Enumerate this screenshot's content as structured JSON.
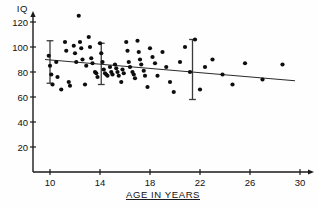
{
  "chart_data": {
    "type": "scatter",
    "title": "",
    "xlabel": "AGE IN YEARS",
    "ylabel": "IQ",
    "xlim": [
      8,
      30.6
    ],
    "ylim": [
      0,
      128
    ],
    "xticks": [
      10,
      14,
      18,
      22,
      26,
      30
    ],
    "xtick_labels": [
      "10",
      "14",
      "18",
      "22",
      "26",
      "30"
    ],
    "yticks": [
      20,
      40,
      60,
      80,
      100,
      120
    ],
    "ytick_labels": [
      "20",
      "40",
      "60",
      "80",
      "100",
      "120"
    ],
    "grid": false,
    "legend": null,
    "points": [
      [
        9.9,
        93
      ],
      [
        10.0,
        85
      ],
      [
        10.1,
        78
      ],
      [
        10.2,
        70
      ],
      [
        10.5,
        88
      ],
      [
        10.6,
        76
      ],
      [
        10.9,
        66
      ],
      [
        11.2,
        104
      ],
      [
        11.3,
        97
      ],
      [
        11.5,
        72
      ],
      [
        11.6,
        69
      ],
      [
        11.9,
        101
      ],
      [
        12.0,
        95
      ],
      [
        12.1,
        88
      ],
      [
        12.3,
        125
      ],
      [
        12.4,
        104
      ],
      [
        12.5,
        99
      ],
      [
        12.6,
        90
      ],
      [
        12.8,
        70
      ],
      [
        12.9,
        85
      ],
      [
        13.1,
        108
      ],
      [
        13.2,
        100
      ],
      [
        13.3,
        91
      ],
      [
        13.4,
        87
      ],
      [
        13.6,
        80
      ],
      [
        13.7,
        79
      ],
      [
        13.8,
        76
      ],
      [
        14.0,
        103
      ],
      [
        14.1,
        95
      ],
      [
        14.2,
        88
      ],
      [
        14.3,
        82
      ],
      [
        14.4,
        79
      ],
      [
        14.5,
        78
      ],
      [
        14.6,
        77
      ],
      [
        14.8,
        84
      ],
      [
        14.9,
        80
      ],
      [
        15.0,
        78
      ],
      [
        15.2,
        86
      ],
      [
        15.3,
        83
      ],
      [
        15.4,
        80
      ],
      [
        15.5,
        77
      ],
      [
        15.7,
        72
      ],
      [
        15.8,
        82
      ],
      [
        15.9,
        79
      ],
      [
        16.1,
        104
      ],
      [
        16.2,
        97
      ],
      [
        16.3,
        88
      ],
      [
        16.4,
        84
      ],
      [
        16.6,
        80
      ],
      [
        16.7,
        78
      ],
      [
        16.8,
        75
      ],
      [
        17.0,
        105
      ],
      [
        17.1,
        96
      ],
      [
        17.2,
        90
      ],
      [
        17.3,
        86
      ],
      [
        17.5,
        81
      ],
      [
        17.6,
        77
      ],
      [
        17.8,
        68
      ],
      [
        18.0,
        99
      ],
      [
        18.2,
        92
      ],
      [
        18.4,
        87
      ],
      [
        18.6,
        77
      ],
      [
        19.0,
        96
      ],
      [
        19.3,
        84
      ],
      [
        19.6,
        72
      ],
      [
        19.9,
        64
      ],
      [
        20.4,
        88
      ],
      [
        20.8,
        100
      ],
      [
        21.2,
        80
      ],
      [
        21.6,
        106
      ],
      [
        22.0,
        66
      ],
      [
        22.4,
        84
      ],
      [
        23.0,
        90
      ],
      [
        23.8,
        78
      ],
      [
        24.6,
        70
      ],
      [
        25.6,
        87
      ],
      [
        27.0,
        74
      ],
      [
        28.6,
        86
      ]
    ],
    "regression_line": {
      "x": [
        9.6,
        29.6
      ],
      "y": [
        90,
        73
      ]
    },
    "error_bars": [
      {
        "x": 10.0,
        "mean": 89,
        "low": 71,
        "high": 105
      },
      {
        "x": 14.1,
        "mean": 87,
        "low": 70,
        "high": 103
      },
      {
        "x": 21.4,
        "mean": 84,
        "low": 58,
        "high": 106
      }
    ]
  },
  "axes": {
    "x_axis_title": "AGE IN YEARS",
    "y_axis_title": "IQ"
  }
}
